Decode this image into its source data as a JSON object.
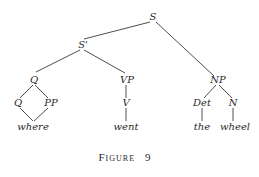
{
  "figure": {
    "caption_word": "Figure",
    "caption_number": "9"
  },
  "nodes": {
    "s": "S",
    "s_prime": "S'",
    "q_top": "Q",
    "vp": "VP",
    "np": "NP",
    "q_child": "Q",
    "pp": "PP",
    "v": "V",
    "det": "Det",
    "n": "N"
  },
  "leaves": {
    "where": "where",
    "went": "went",
    "the": "the",
    "wheel": "wheel"
  },
  "colors": {
    "line": "#3a3a3a",
    "text": "#2a2a2a",
    "background": "#ffffff"
  }
}
